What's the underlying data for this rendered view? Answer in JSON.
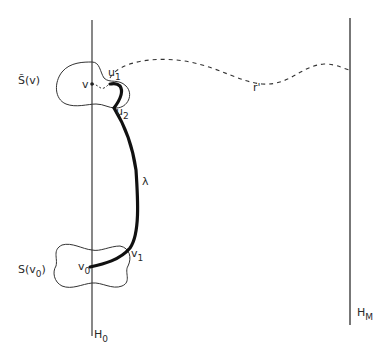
{
  "diagram": {
    "type": "graph-path-illustration",
    "lines": {
      "left_hyperplane": {
        "label": "H",
        "subscript": "0"
      },
      "right_hyperplane": {
        "label": "H",
        "subscript": "M"
      }
    },
    "regions": {
      "top_region": {
        "label": "S̃(v)"
      },
      "bottom_region": {
        "label": "S(v",
        "subscript": "0",
        "suffix": ")"
      }
    },
    "points": {
      "v": {
        "label": "v"
      },
      "v0": {
        "label": "v",
        "subscript": "0"
      },
      "v1": {
        "label": "v",
        "subscript": "1"
      },
      "u1": {
        "label": "u",
        "subscript": "1"
      },
      "u2": {
        "label": "u",
        "subscript": "2"
      }
    },
    "paths": {
      "lambda": {
        "label": "λ",
        "style": "solid-thick"
      },
      "r_prime": {
        "label": "r'",
        "style": "dashed"
      }
    },
    "colors": {
      "ink": "#2a2a2a",
      "background": "#ffffff"
    }
  }
}
